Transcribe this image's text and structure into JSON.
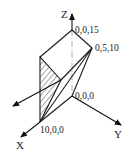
{
  "figure": {
    "type": "3d-coordinate-diagram",
    "axes": {
      "x_label": "X",
      "y_label": "Y",
      "z_label": "Z"
    },
    "points": [
      {
        "id": "origin",
        "label": "0,0,0"
      },
      {
        "id": "z_top",
        "label": "0,0,15"
      },
      {
        "id": "yz_point",
        "label": "0,5,10"
      },
      {
        "id": "x_point",
        "label": "10,0,0"
      }
    ],
    "hatched_face": "triangular cross-section on left face",
    "load_arrow": "normal vector pointing down-left",
    "colors": {
      "line": "#1a1a1a",
      "background": "#ffffff",
      "hidden_line": "#9a9a9a"
    }
  }
}
